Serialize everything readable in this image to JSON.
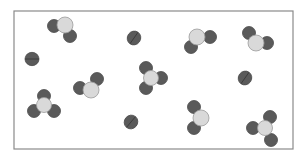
{
  "diagram": {
    "type": "particle-model",
    "frame": {
      "x": 14,
      "y": 11,
      "width": 279,
      "height": 138,
      "stroke": "#8a8a8a"
    },
    "colors": {
      "dark_atom": "#5a5a5a",
      "dark_atom_edge": "#4a4a4a",
      "light_atom": "#d9d9d9",
      "light_atom_edge": "#9a9a9a",
      "bond_line": "#3a3a3a"
    },
    "molecules": [
      {
        "kind": "bent-triatomic",
        "atoms": [
          {
            "x": 54,
            "y": 26,
            "r": 6.5,
            "shade": "dark"
          },
          {
            "x": 70,
            "y": 36,
            "r": 6.5,
            "shade": "dark"
          },
          {
            "x": 65,
            "y": 25,
            "r": 8,
            "shade": "light"
          }
        ]
      },
      {
        "kind": "diatomic",
        "x": 134,
        "y": 38,
        "r": 7,
        "angle": -55
      },
      {
        "kind": "bent-triatomic",
        "atoms": [
          {
            "x": 210,
            "y": 37,
            "r": 6.5,
            "shade": "dark"
          },
          {
            "x": 191,
            "y": 47,
            "r": 6.5,
            "shade": "dark"
          },
          {
            "x": 197,
            "y": 37,
            "r": 8,
            "shade": "light"
          }
        ]
      },
      {
        "kind": "bent-triatomic",
        "atoms": [
          {
            "x": 249,
            "y": 33,
            "r": 6.5,
            "shade": "dark"
          },
          {
            "x": 267,
            "y": 43,
            "r": 6.5,
            "shade": "dark"
          },
          {
            "x": 256,
            "y": 43,
            "r": 8,
            "shade": "light"
          }
        ]
      },
      {
        "kind": "diatomic",
        "x": 32,
        "y": 59,
        "r": 7,
        "angle": 0
      },
      {
        "kind": "bent-triatomic",
        "atoms": [
          {
            "x": 80,
            "y": 88,
            "r": 6.5,
            "shade": "dark"
          },
          {
            "x": 97,
            "y": 79,
            "r": 6.5,
            "shade": "dark"
          },
          {
            "x": 91,
            "y": 90,
            "r": 8,
            "shade": "light"
          }
        ]
      },
      {
        "kind": "trigonal",
        "atoms": [
          {
            "x": 146,
            "y": 68,
            "r": 6.5,
            "shade": "dark"
          },
          {
            "x": 161,
            "y": 78,
            "r": 6.5,
            "shade": "dark"
          },
          {
            "x": 146,
            "y": 88,
            "r": 6.5,
            "shade": "dark"
          },
          {
            "x": 151,
            "y": 78,
            "r": 7.5,
            "shade": "light"
          }
        ]
      },
      {
        "kind": "diatomic",
        "x": 245,
        "y": 78,
        "r": 7,
        "angle": -55
      },
      {
        "kind": "trigonal",
        "atoms": [
          {
            "x": 44,
            "y": 96,
            "r": 6.5,
            "shade": "dark"
          },
          {
            "x": 34,
            "y": 111,
            "r": 6.5,
            "shade": "dark"
          },
          {
            "x": 54,
            "y": 111,
            "r": 6.5,
            "shade": "dark"
          },
          {
            "x": 44,
            "y": 105,
            "r": 7.5,
            "shade": "light"
          }
        ]
      },
      {
        "kind": "diatomic",
        "x": 131,
        "y": 122,
        "r": 7,
        "angle": -50
      },
      {
        "kind": "bent-triatomic",
        "atoms": [
          {
            "x": 194,
            "y": 107,
            "r": 6.5,
            "shade": "dark"
          },
          {
            "x": 194,
            "y": 128,
            "r": 6.5,
            "shade": "dark"
          },
          {
            "x": 201,
            "y": 118,
            "r": 8,
            "shade": "light"
          }
        ]
      },
      {
        "kind": "trigonal",
        "atoms": [
          {
            "x": 270,
            "y": 117,
            "r": 6.5,
            "shade": "dark"
          },
          {
            "x": 253,
            "y": 128,
            "r": 6.5,
            "shade": "dark"
          },
          {
            "x": 271,
            "y": 140,
            "r": 6.5,
            "shade": "dark"
          },
          {
            "x": 265,
            "y": 128,
            "r": 7.5,
            "shade": "light"
          }
        ]
      }
    ]
  }
}
